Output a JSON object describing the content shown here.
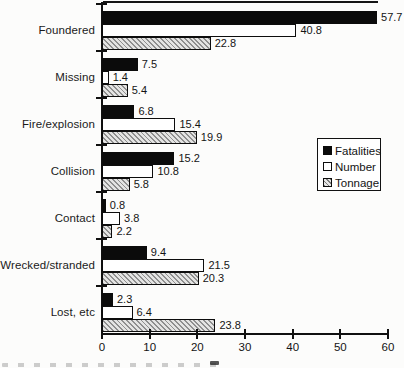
{
  "figure": {
    "background": "#fcfcfb",
    "has_top_rule": true,
    "has_cutoff_caption_fragment": true
  },
  "colors": {
    "bar_black": "#0b0b0b",
    "bar_white_fill": "#ffffff",
    "bar_outline": "#0d0d0d",
    "hatch_line": "#8f8f8f",
    "hatch_background": "#e4e4e3",
    "axis": "#101010",
    "text": "#161616"
  },
  "chart_data": {
    "type": "bar",
    "orientation": "horizontal",
    "title": "",
    "xlabel": "",
    "ylabel": "",
    "categories": [
      "Foundered",
      "Missing",
      "Fire/explosion",
      "Collision",
      "Contact",
      "Wrecked/stranded",
      "Lost, etc"
    ],
    "series": [
      {
        "name": "Fatalities",
        "style": "solid-black",
        "values": [
          57.7,
          7.5,
          6.8,
          15.2,
          0.8,
          9.4,
          2.3
        ]
      },
      {
        "name": "Number",
        "style": "white-outlined",
        "values": [
          40.8,
          1.4,
          15.4,
          10.8,
          3.8,
          21.5,
          6.4
        ]
      },
      {
        "name": "Tonnage",
        "style": "diagonal-hatch",
        "values": [
          22.8,
          5.4,
          19.9,
          5.8,
          2.2,
          20.3,
          23.8
        ]
      }
    ],
    "xlim": [
      0,
      60
    ],
    "x_ticks": [
      0,
      10,
      20,
      30,
      40,
      50,
      60
    ],
    "value_labels": true,
    "grid": false,
    "legend_position": "middle-right"
  }
}
